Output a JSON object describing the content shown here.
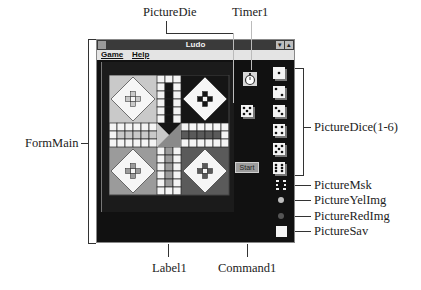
{
  "window": {
    "title": "Ludo",
    "menu": [
      {
        "label": "Game"
      },
      {
        "label": "Help"
      }
    ],
    "title_buttons": [
      "▾",
      "▴"
    ],
    "start_button_label": "Start"
  },
  "callouts": {
    "picture_die": "PictureDie",
    "timer1": "Timer1",
    "picture_dice": "PictureDice(1-6)",
    "form_main": "FormMain",
    "picture_msk": "PictureMsk",
    "picture_yel_img": "PictureYelImg",
    "picture_red_img": "PictureRedImg",
    "picture_sav": "PictureSav",
    "label1": "Label1",
    "command1": "Command1"
  },
  "dice_faces": [
    1,
    2,
    3,
    4,
    5,
    6
  ],
  "current_die_face": 5,
  "colors": {
    "home_top_left": "#c9c9c9",
    "home_top_right": "#151515",
    "home_bottom_left": "#9b9b9b",
    "home_bottom_right": "#5a5a5a",
    "path_white": "#f4f4f4",
    "grid_line": "#222222",
    "yellow_token": "#bdbdbd",
    "red_token": "#555555"
  }
}
